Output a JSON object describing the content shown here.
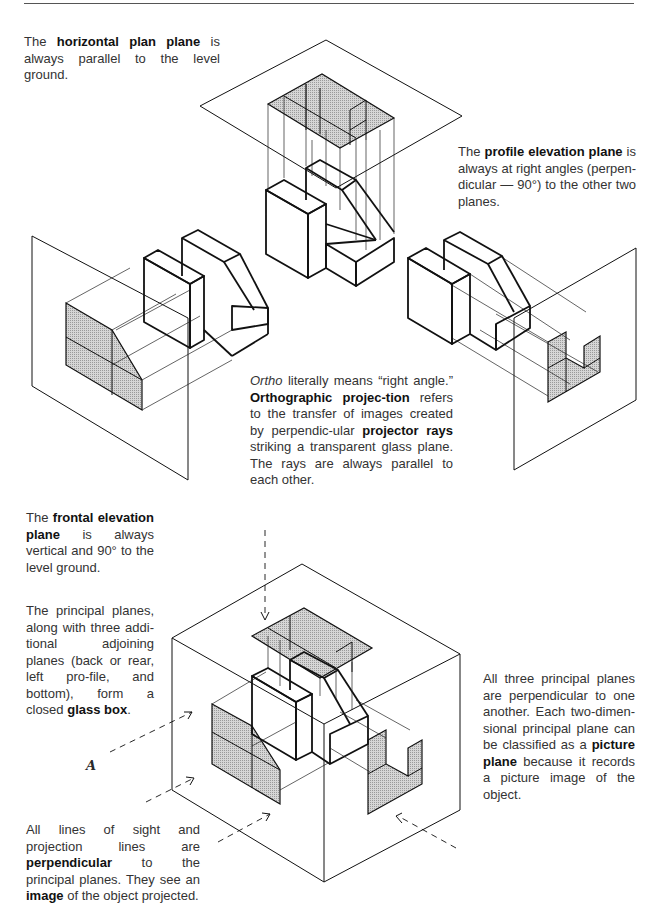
{
  "page": {
    "domain": "Diagram"
  },
  "captions": {
    "horizontal_plane": {
      "pre": "The ",
      "bold": "horizontal plan plane",
      "post": " is always parallel to the level ground."
    },
    "profile_plane": {
      "pre": "The ",
      "bold": "profile elevation plane",
      "post": " is always at right angles (perpen-dicular — 90°) to the other two planes."
    },
    "ortho": {
      "italic": "Ortho",
      "part1": " literally means “right angle.” ",
      "bold1": "Orthographic projec-tion",
      "part2": " refers to the transfer of images created by perpendic-ular ",
      "bold2": "projector rays",
      "part3": " striking a transparent glass plane. The rays are always parallel to each other."
    },
    "frontal_plane": {
      "pre": "The ",
      "bold": "frontal elevation plane",
      "post": " is always vertical and 90° to the level ground."
    },
    "glass_box": {
      "pre": "The principal planes, along with three addi-tional adjoining planes (back or rear, left pro-file, and bottom), form a closed ",
      "bold": "glass box",
      "post": "."
    },
    "picture_plane": {
      "pre": "All three principal planes are perpendicular to one another. Each two-dimen-sional principal plane can be classified as a ",
      "bold": "picture plane",
      "post": " because it records a picture image of the object."
    },
    "lines_of_sight": {
      "pre": "All lines of sight and projection lines are ",
      "bold1": "perpendicular",
      "mid": " to the principal planes. They see an ",
      "bold2": "image",
      "post": " of the object projected."
    }
  },
  "annotations": {
    "viewer_mark": "A"
  },
  "figures": [
    {
      "name": "horizontal-plan-plane-projection",
      "view": "top"
    },
    {
      "name": "frontal-elevation-plane-projection",
      "view": "front"
    },
    {
      "name": "profile-elevation-plane-projection",
      "view": "right-side"
    },
    {
      "name": "glass-box",
      "view": "combined"
    }
  ],
  "colors": {
    "line": "#111111",
    "shade": "#bdbdbd",
    "text": "#333333"
  }
}
